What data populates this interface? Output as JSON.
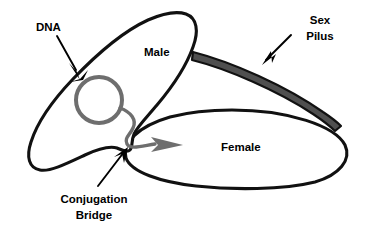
{
  "diagram": {
    "background_color": "#ffffff",
    "labels": {
      "dna": "DNA",
      "male": "Male",
      "female": "Female",
      "sex_pilus_line1": "Sex",
      "sex_pilus_line2": "Pilus",
      "conjugation_bridge_line1": "Conjugation",
      "conjugation_bridge_line2": "Bridge"
    },
    "colors": {
      "outline": "#111111",
      "plasmid": "#6e6e6e",
      "pilus_fill": "#4f4f4f",
      "pilus_stroke": "#111111",
      "text": "#000000",
      "background": "#ffffff"
    },
    "parts": [
      {
        "name": "male-cell",
        "label": "Male",
        "shape": "tilted-ellipse-lobe"
      },
      {
        "name": "female-cell",
        "label": "Female",
        "shape": "horizontal-ellipse"
      },
      {
        "name": "plasmid-dna",
        "label": "DNA",
        "shape": "circle-with-tail"
      },
      {
        "name": "sex-pilus",
        "label": "Sex Pilus",
        "shape": "tapered-band"
      },
      {
        "name": "conjugation-bridge",
        "label": "Conjugation Bridge",
        "shape": "membrane-junction"
      }
    ]
  }
}
